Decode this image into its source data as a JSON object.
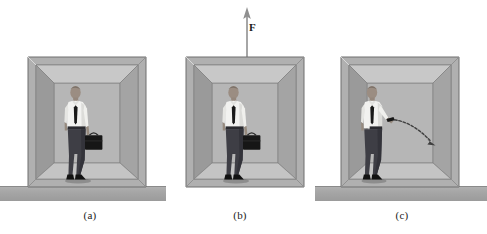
{
  "figure": {
    "background_color": "#ffffff",
    "width": 487,
    "height": 234
  },
  "panels": [
    {
      "id": "a",
      "label": "(a)",
      "caption_x": 60,
      "caption_y": 209,
      "box": {
        "x": 28,
        "y": 57,
        "w": 118,
        "h": 131
      },
      "has_ground": true,
      "has_force_arrow": false,
      "has_trajectory": false,
      "person": {
        "pose": "standing-holding-briefcase",
        "shirt_color": "#f2f2f0",
        "tie_color": "#1a1a1a",
        "pants_color": "#3c3c42",
        "skin_color": "#9a8b80",
        "briefcase_color": "#161616",
        "shoe_color": "#121212"
      }
    },
    {
      "id": "b",
      "label": "(b)",
      "caption_x": 210,
      "caption_y": 209,
      "box": {
        "x": 186,
        "y": 57,
        "w": 118,
        "h": 131
      },
      "has_ground": false,
      "has_force_arrow": true,
      "has_trajectory": false,
      "person": {
        "pose": "standing-holding-briefcase",
        "shirt_color": "#f2f2f0",
        "tie_color": "#1a1a1a",
        "pants_color": "#3c3c42",
        "skin_color": "#9a8b80",
        "briefcase_color": "#161616",
        "shoe_color": "#121212"
      }
    },
    {
      "id": "c",
      "label": "(c)",
      "caption_x": 372,
      "caption_y": 209,
      "box": {
        "x": 341,
        "y": 57,
        "w": 118,
        "h": 131
      },
      "has_ground": true,
      "has_force_arrow": false,
      "has_trajectory": true,
      "person": {
        "pose": "arm-extended-released-briefcase",
        "shirt_color": "#f2f2f0",
        "tie_color": "#1a1a1a",
        "pants_color": "#3c3c42",
        "skin_color": "#9a8b80",
        "briefcase_color": "#161616",
        "shoe_color": "#121212"
      }
    }
  ],
  "force_arrow": {
    "symbol": "F",
    "direction": "up",
    "color": "#909090",
    "label_color": "#1a1a1a",
    "tip_y": 8,
    "tail_y": 57,
    "x": 245,
    "label_x": 249,
    "label_y": 28
  },
  "trajectory": {
    "description": "dashed projectile arc with arrowhead",
    "color": "#4a4a4a",
    "style": "dashed",
    "start_x": 390,
    "start_y": 121,
    "end_x": 437,
    "end_y": 145
  },
  "grounds": [
    {
      "panel": "a",
      "x": 0,
      "y": 186,
      "w": 166,
      "h": 14
    },
    {
      "panel": "c",
      "x": 315,
      "y": 186,
      "w": 172,
      "h": 14
    }
  ],
  "colors": {
    "box_frame_outer": "#a9a9a9",
    "box_frame_edge": "#6f6f6f",
    "box_wall_back": "#b4b4b4",
    "box_wall_left": "#9d9d9d",
    "box_wall_right": "#a5a5a5",
    "box_ceiling": "#c6c6c6",
    "box_floor": "#c2c2c2",
    "ground": "#a6a6a6",
    "caption_text": "#222222"
  }
}
